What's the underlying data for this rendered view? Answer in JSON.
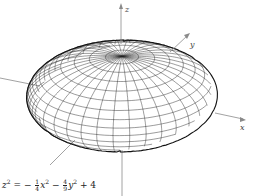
{
  "figure": {
    "type": "ellipsoid-wireframe",
    "axes": {
      "x_label": "x",
      "y_label": "y",
      "z_label": "z"
    },
    "equation": {
      "lhs_var": "z",
      "lhs_exp": "2",
      "eq": "=",
      "term1_sign": "−",
      "term1_num": "1",
      "term1_den": "4",
      "term1_var": "x",
      "term1_exp": "2",
      "term2_sign": "−",
      "term2_num": "4",
      "term2_den": "9",
      "term2_var": "y",
      "term2_exp": "2",
      "const": "+ 4"
    },
    "colors": {
      "mesh": "#222222",
      "axis": "#8a8a8a",
      "background": "#ffffff"
    }
  }
}
